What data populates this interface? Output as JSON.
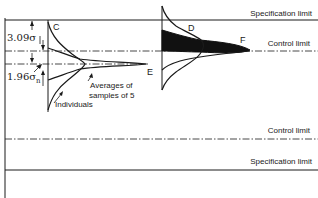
{
  "diagram": {
    "limits": {
      "upper_spec": "Specification limit",
      "upper_control": "Control limit",
      "lower_control": "Control limit",
      "lower_spec": "Specification limit"
    },
    "dimensions": {
      "upper_gap": "3.09σ",
      "lower_gap_main": "1.96σ",
      "lower_gap_sub": "n"
    },
    "points": {
      "c": "C",
      "d": "D",
      "e": "E",
      "f": "F"
    },
    "annotations": {
      "averages_line1": "Averages of",
      "averages_line2": "samples of 5",
      "individuals": "Individuals"
    },
    "colors": {
      "ink": "#1a1a1a",
      "background": "#ffffff"
    }
  }
}
